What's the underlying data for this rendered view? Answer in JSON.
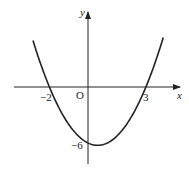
{
  "chart_data": {
    "type": "line",
    "title": "",
    "function": "y = x^2 - x - 6",
    "xlabel": "x",
    "ylabel": "y",
    "origin_label": "O",
    "x_tick_labels": [
      "-2",
      "3"
    ],
    "y_tick_labels": [
      "-6"
    ],
    "x_intercepts": [
      -2,
      3
    ],
    "y_intercept": -6,
    "vertex": [
      0.5,
      -6.25
    ],
    "xlim": [
      -3.8,
      4.7
    ],
    "ylim": [
      -8.2,
      8.2
    ],
    "grid": false,
    "series": [
      {
        "name": "parabola",
        "x": [
          -2.85,
          -2,
          -1,
          0,
          0.5,
          1,
          2,
          3,
          3.9
        ],
        "y": [
          4.97,
          0,
          -4,
          -6,
          -6.25,
          -6,
          -4,
          0,
          5.31
        ]
      }
    ]
  },
  "labels": {
    "y": "y",
    "x": "x",
    "origin": "O",
    "neg2": "−2",
    "three": "3",
    "neg6": "−6"
  }
}
